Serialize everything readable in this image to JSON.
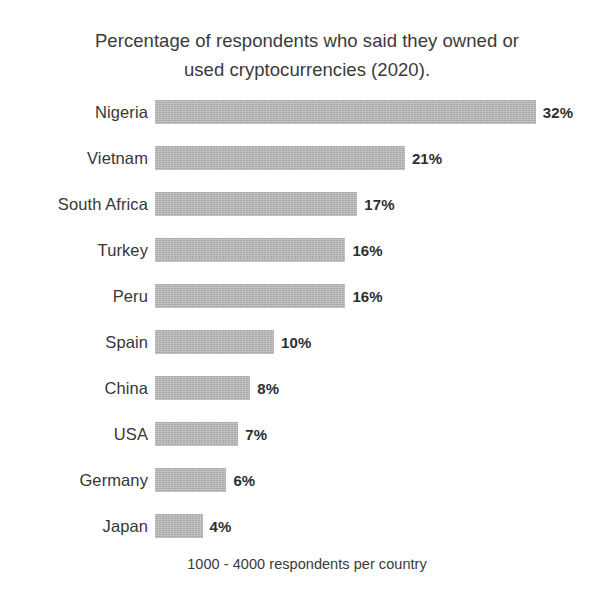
{
  "chart_data": {
    "type": "bar",
    "orientation": "horizontal",
    "title": "Percentage of respondents who said they owned or used cryptocurrencies (2020).",
    "title_lines": [
      "Percentage of respondents who said they owned or",
      "used cryptocurrencies (2020)."
    ],
    "footnote": "1000 - 4000 respondents per country",
    "xlabel": "",
    "ylabel": "",
    "xlim": [
      0,
      32
    ],
    "grid": false,
    "legend": null,
    "bar_color": "#b8b8b8",
    "text_color": "#3a3a3a",
    "value_suffix": "%",
    "categories": [
      "Nigeria",
      "Vietnam",
      "South Africa",
      "Turkey",
      "Peru",
      "Spain",
      "China",
      "USA",
      "Germany",
      "Japan"
    ],
    "values": [
      32,
      21,
      17,
      16,
      16,
      10,
      8,
      7,
      6,
      4
    ],
    "value_labels": [
      "32%",
      "21%",
      "17%",
      "16%",
      "16%",
      "10%",
      "8%",
      "7%",
      "6%",
      "4%"
    ],
    "bars": [
      {
        "category": "Nigeria",
        "value": 32,
        "value_label": "32%"
      },
      {
        "category": "Vietnam",
        "value": 21,
        "value_label": "21%"
      },
      {
        "category": "South Africa",
        "value": 17,
        "value_label": "17%"
      },
      {
        "category": "Turkey",
        "value": 16,
        "value_label": "16%"
      },
      {
        "category": "Peru",
        "value": 16,
        "value_label": "16%"
      },
      {
        "category": "Spain",
        "value": 10,
        "value_label": "10%"
      },
      {
        "category": "China",
        "value": 8,
        "value_label": "8%"
      },
      {
        "category": "USA",
        "value": 7,
        "value_label": "7%"
      },
      {
        "category": "Germany",
        "value": 6,
        "value_label": "6%"
      },
      {
        "category": "Japan",
        "value": 4,
        "value_label": "4%"
      }
    ]
  }
}
